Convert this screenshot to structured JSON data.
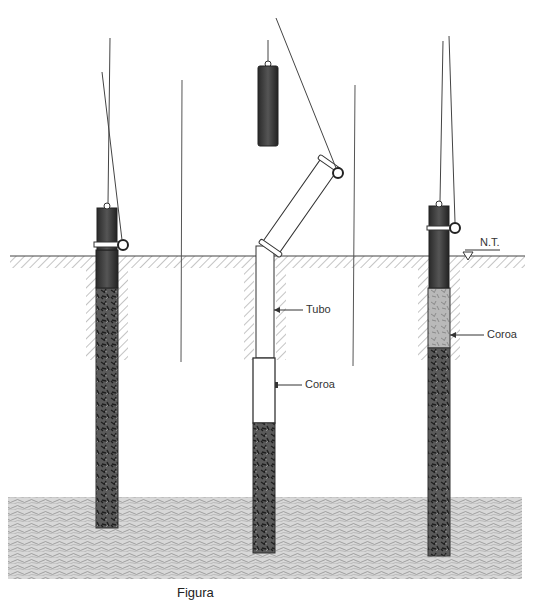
{
  "figure": {
    "caption": "Figura"
  },
  "labels": {
    "ground_level": "N.T.",
    "tube": "Tubo",
    "crown_middle": "Coroa",
    "crown_right": "Coroa"
  },
  "colors": {
    "hammer": "#3a3a3a",
    "concrete": "#555555",
    "soil_hatch": "#888888",
    "line": "#444444",
    "bearing_layer": "#bdbdbd"
  },
  "stages": [
    {
      "name": "stage-1-driving",
      "x": 107
    },
    {
      "name": "stage-2-tube-placement",
      "x": 265
    },
    {
      "name": "stage-3-crown-driving",
      "x": 438
    }
  ]
}
